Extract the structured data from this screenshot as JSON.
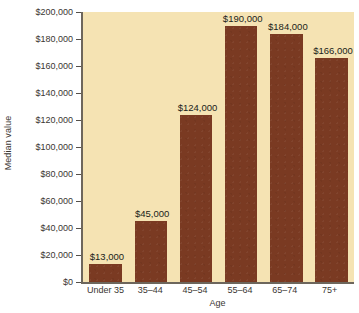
{
  "chart_data": {
    "type": "bar",
    "title": "",
    "subtitle": "",
    "xlabel": "Age",
    "ylabel": "Median value",
    "categories": [
      "Under 35",
      "35–44",
      "45–54",
      "55–64",
      "65–74",
      "75+"
    ],
    "values": [
      13000,
      45000,
      124000,
      190000,
      184000,
      166000
    ],
    "data_labels": [
      "$13,000",
      "$45,000",
      "$124,000",
      "$190,000",
      "$184,000",
      "$166,000"
    ],
    "ylim": [
      0,
      200000
    ],
    "ytick_values": [
      0,
      20000,
      40000,
      60000,
      80000,
      100000,
      120000,
      140000,
      160000,
      180000,
      200000
    ],
    "ytick_labels": [
      "$0",
      "$20,000",
      "$40,000",
      "$60,000",
      "$80,000",
      "$100,000",
      "$120,000",
      "$140,000",
      "$160,000",
      "$180,000",
      "$200,000"
    ],
    "grid": false,
    "legend": false,
    "legend_position": "none",
    "colors": {
      "bar": "#7a3a22",
      "plot_background": "#f5e3b3",
      "axis": "#6d665c",
      "text": "#3a3632",
      "data_label": "#201d1a",
      "figure_background": "#ffffff"
    }
  }
}
